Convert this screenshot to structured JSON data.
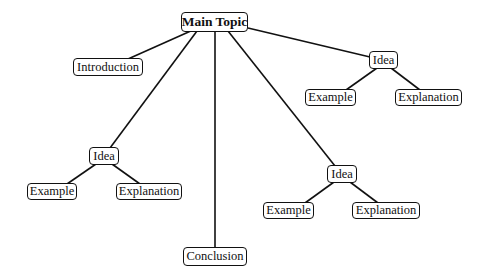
{
  "diagram": {
    "type": "mind-map",
    "line_color": "#111111",
    "nodes": {
      "main": {
        "label": "Main Topic"
      },
      "introduction": {
        "label": "Introduction"
      },
      "conclusion": {
        "label": "Conclusion"
      },
      "idea_right": {
        "label": "Idea",
        "example": "Example",
        "explanation": "Explanation"
      },
      "idea_left": {
        "label": "Idea",
        "example": "Example",
        "explanation": "Explanation"
      },
      "idea_middle": {
        "label": "Idea",
        "example": "Example",
        "explanation": "Explanation"
      }
    },
    "edges": [
      [
        "Main Topic",
        "Introduction"
      ],
      [
        "Main Topic",
        "Idea (left)"
      ],
      [
        "Main Topic",
        "Conclusion"
      ],
      [
        "Main Topic",
        "Idea (middle)"
      ],
      [
        "Main Topic",
        "Idea (right)"
      ],
      [
        "Idea (right)",
        "Example"
      ],
      [
        "Idea (right)",
        "Explanation"
      ],
      [
        "Idea (left)",
        "Example"
      ],
      [
        "Idea (left)",
        "Explanation"
      ],
      [
        "Idea (middle)",
        "Example"
      ],
      [
        "Idea (middle)",
        "Explanation"
      ]
    ]
  }
}
